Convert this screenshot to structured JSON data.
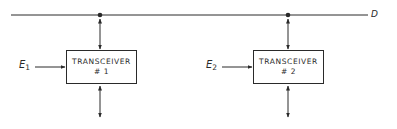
{
  "diagram": {
    "bus": {
      "label": "D"
    },
    "transceivers": [
      {
        "title": "TRANSCEIVER",
        "number": "# 1",
        "input_label": "E",
        "input_subscript": "1"
      },
      {
        "title": "TRANSCEIVER",
        "number": "# 2",
        "input_label": "E",
        "input_subscript": "2"
      }
    ],
    "colors": {
      "line": "#2a2a2a",
      "background": "#ffffff"
    }
  }
}
